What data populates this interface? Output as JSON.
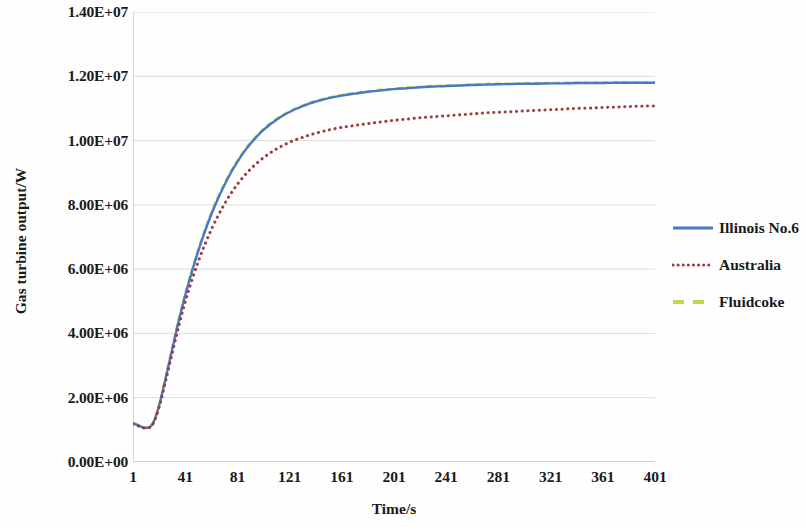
{
  "chart_data": {
    "type": "line",
    "title": "",
    "xlabel": "Time/s",
    "ylabel": "Gas turbine output/W",
    "xlim": [
      1,
      401
    ],
    "ylim": [
      0,
      14000000
    ],
    "grid": "horizontal",
    "legend_position": "right",
    "x_ticks": [
      "1",
      "41",
      "81",
      "121",
      "161",
      "201",
      "241",
      "281",
      "321",
      "361",
      "401"
    ],
    "x_tick_values": [
      1,
      41,
      81,
      121,
      161,
      201,
      241,
      281,
      321,
      361,
      401
    ],
    "y_ticks": [
      "0.00E+00",
      "2.00E+06",
      "4.00E+06",
      "6.00E+06",
      "8.00E+06",
      "1.00E+07",
      "1.20E+07",
      "1.40E+07"
    ],
    "y_tick_values": [
      0,
      2000000,
      4000000,
      6000000,
      8000000,
      10000000,
      12000000,
      14000000
    ],
    "x": [
      1,
      6,
      11,
      16,
      21,
      26,
      31,
      36,
      41,
      46,
      51,
      56,
      61,
      66,
      71,
      76,
      81,
      86,
      91,
      96,
      101,
      106,
      111,
      116,
      121,
      126,
      131,
      136,
      141,
      146,
      151,
      161,
      171,
      181,
      191,
      201,
      211,
      221,
      231,
      241,
      251,
      261,
      271,
      281,
      291,
      301,
      311,
      321,
      331,
      341,
      351,
      361,
      371,
      381,
      391,
      401
    ],
    "series": [
      {
        "name": "Illinois No.6",
        "color": "#4878c8",
        "style": "solid",
        "values": [
          1200000,
          1120000,
          1060000,
          1180000,
          1750000,
          2600000,
          3500000,
          4380000,
          5180000,
          5900000,
          6560000,
          7160000,
          7700000,
          8180000,
          8610000,
          9000000,
          9340000,
          9640000,
          9900000,
          10130000,
          10330000,
          10500000,
          10650000,
          10780000,
          10890000,
          10990000,
          11070000,
          11150000,
          11210000,
          11270000,
          11320000,
          11400000,
          11460000,
          11520000,
          11560000,
          11600000,
          11630000,
          11660000,
          11680000,
          11700000,
          11710000,
          11730000,
          11740000,
          11750000,
          11760000,
          11770000,
          11770000,
          11780000,
          11780000,
          11790000,
          11790000,
          11790000,
          11800000,
          11800000,
          11800000,
          11800000
        ]
      },
      {
        "name": "Australia",
        "color": "#9e3b3b",
        "style": "dotted",
        "values": [
          1180000,
          1110000,
          1050000,
          1160000,
          1700000,
          2520000,
          3380000,
          4210000,
          4980000,
          5640000,
          6230000,
          6760000,
          7230000,
          7650000,
          8020000,
          8350000,
          8640000,
          8890000,
          9110000,
          9300000,
          9470000,
          9610000,
          9740000,
          9850000,
          9950000,
          10030000,
          10100000,
          10170000,
          10230000,
          10280000,
          10330000,
          10410000,
          10470000,
          10530000,
          10580000,
          10630000,
          10670000,
          10710000,
          10740000,
          10770000,
          10800000,
          10830000,
          10860000,
          10880000,
          10900000,
          10920000,
          10940000,
          10960000,
          10980000,
          11000000,
          11010000,
          11030000,
          11040000,
          11060000,
          11070000,
          11080000
        ]
      },
      {
        "name": "Fluidcoke",
        "color": "#c4d64a",
        "style": "dashed",
        "values": [
          1220000,
          1140000,
          1070000,
          1200000,
          1790000,
          2650000,
          3560000,
          4440000,
          5240000,
          5960000,
          6620000,
          7220000,
          7760000,
          8240000,
          8660000,
          9050000,
          9380000,
          9680000,
          9940000,
          10160000,
          10360000,
          10530000,
          10680000,
          10800000,
          10910000,
          11010000,
          11090000,
          11170000,
          11230000,
          11290000,
          11340000,
          11420000,
          11480000,
          11530000,
          11580000,
          11610000,
          11650000,
          11670000,
          11700000,
          11710000,
          11730000,
          11740000,
          11760000,
          11770000,
          11770000,
          11780000,
          11790000,
          11790000,
          11800000,
          11800000,
          11800000,
          11810000,
          11810000,
          11810000,
          11810000,
          11810000
        ]
      }
    ]
  },
  "legend": {
    "items": [
      {
        "label": "Illinois No.6",
        "color": "#4878c8",
        "style": "solid"
      },
      {
        "label": "Australia",
        "color": "#9e3b3b",
        "style": "dotted"
      },
      {
        "label": "Fluidcoke",
        "color": "#c4d64a",
        "style": "dashed"
      }
    ]
  },
  "colors": {
    "gridline": "#d9d9d9",
    "axis": "#b0b0b0",
    "text": "#1a1a1a",
    "background": "#ffffff"
  }
}
